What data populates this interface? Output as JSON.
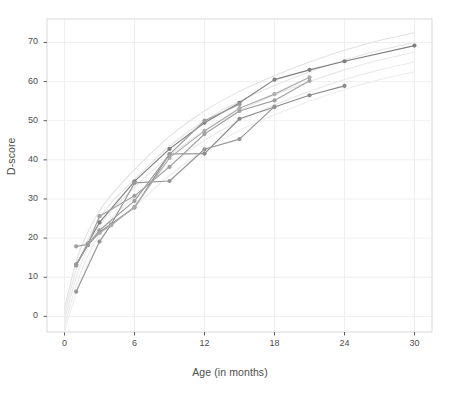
{
  "chart_data": {
    "type": "line",
    "title": "",
    "xlabel": "Age (in months)",
    "ylabel": "D-score",
    "xlim": [
      -1.5,
      31.5
    ],
    "ylim": [
      -4,
      76
    ],
    "xticks": [
      0,
      6,
      12,
      18,
      24,
      30
    ],
    "yticks": [
      0,
      10,
      20,
      30,
      40,
      50,
      60,
      70
    ],
    "grid": true,
    "legend": "none",
    "markers": "filled-circle",
    "series": [
      {
        "name": "child-1",
        "color": "#7f7f7f",
        "x": [
          1,
          2,
          3,
          6,
          9,
          12,
          15,
          18,
          21,
          24,
          30
        ],
        "y": [
          13.0,
          18.6,
          24.0,
          34.5,
          42.8,
          49.5,
          54.6,
          60.5,
          63.0,
          65.2,
          69.2
        ]
      },
      {
        "name": "child-2",
        "color": "#8a8a8a",
        "x": [
          1,
          2,
          3,
          6,
          9,
          12,
          15,
          18,
          21,
          24
        ],
        "y": [
          13.3,
          18.2,
          21.5,
          27.8,
          41.5,
          41.6,
          50.5,
          53.5,
          56.5,
          58.9
        ]
      },
      {
        "name": "child-3",
        "color": "#969696",
        "x": [
          1,
          3,
          4,
          6,
          9,
          12,
          15,
          18
        ],
        "y": [
          6.3,
          19.1,
          23.5,
          34.1,
          34.6,
          42.7,
          45.3,
          53.6
        ]
      },
      {
        "name": "child-4",
        "color": "#a0a0a0",
        "x": [
          1,
          2,
          3,
          6,
          9,
          12,
          15,
          18,
          21
        ],
        "y": [
          17.9,
          18.4,
          25.6,
          30.8,
          38.2,
          46.6,
          52.5,
          55.2,
          60.2
        ]
      },
      {
        "name": "child-5",
        "color": "#ababab",
        "x": [
          2,
          3,
          4,
          6,
          9,
          12,
          15,
          18,
          21
        ],
        "y": [
          18.5,
          21.3,
          23.3,
          28.0,
          40.5,
          47.4,
          53.2,
          56.8,
          61.1
        ]
      },
      {
        "name": "child-6",
        "color": "#9c9c9c",
        "x": [
          1,
          2,
          3,
          6,
          9,
          12,
          15
        ],
        "y": [
          13.1,
          18.3,
          22.0,
          29.5,
          41.4,
          50.0,
          54.2
        ]
      }
    ],
    "reference_curves": [
      {
        "name": "reference-p90",
        "color": "#e2e2e2",
        "x": [
          0,
          1,
          2,
          3,
          4,
          6,
          9,
          12,
          15,
          18,
          21,
          24,
          27,
          30
        ],
        "y": [
          2.0,
          14.0,
          21.5,
          27.0,
          31.0,
          37.5,
          46.0,
          52.5,
          57.5,
          61.5,
          65.0,
          68.0,
          70.5,
          72.5
        ]
      },
      {
        "name": "reference-p75",
        "color": "#e5e5e5",
        "x": [
          0,
          1,
          2,
          3,
          4,
          6,
          9,
          12,
          15,
          18,
          21,
          24,
          27,
          30
        ],
        "y": [
          0.5,
          12.0,
          19.5,
          25.0,
          29.0,
          35.0,
          43.5,
          50.0,
          55.0,
          59.0,
          62.5,
          65.5,
          68.0,
          70.0
        ]
      },
      {
        "name": "reference-p50",
        "color": "#e8e8e8",
        "x": [
          0,
          1,
          2,
          3,
          4,
          6,
          9,
          12,
          15,
          18,
          21,
          24,
          27,
          30
        ],
        "y": [
          -1.0,
          10.0,
          17.5,
          23.0,
          27.0,
          33.0,
          41.0,
          47.5,
          52.5,
          56.5,
          60.0,
          63.0,
          65.5,
          67.5
        ]
      },
      {
        "name": "reference-p25",
        "color": "#ebebeb",
        "x": [
          0,
          1,
          2,
          3,
          4,
          6,
          9,
          12,
          15,
          18,
          21,
          24,
          27,
          30
        ],
        "y": [
          -2.5,
          8.0,
          15.5,
          21.0,
          25.0,
          30.5,
          38.5,
          45.0,
          50.0,
          54.0,
          57.5,
          60.5,
          63.0,
          65.0
        ]
      },
      {
        "name": "reference-p10",
        "color": "#ededed",
        "x": [
          0,
          1,
          2,
          3,
          4,
          6,
          9,
          12,
          15,
          18,
          21,
          24,
          27,
          30
        ],
        "y": [
          -4.0,
          6.0,
          13.5,
          19.0,
          23.0,
          28.0,
          36.0,
          42.5,
          47.5,
          51.5,
          55.0,
          58.0,
          60.5,
          62.5
        ]
      }
    ]
  },
  "axes": {
    "y_title": "D-score",
    "x_title": "Age (in months)",
    "y_tick_labels": [
      "0",
      "10",
      "20",
      "30",
      "40",
      "50",
      "60",
      "70"
    ],
    "x_tick_labels": [
      "0",
      "6",
      "12",
      "18",
      "24",
      "30"
    ]
  },
  "style": {
    "panel_border": "#d9d9d9",
    "grid_color": "#ededed",
    "tick_color": "#4d4d4d",
    "background": "#ffffff"
  }
}
